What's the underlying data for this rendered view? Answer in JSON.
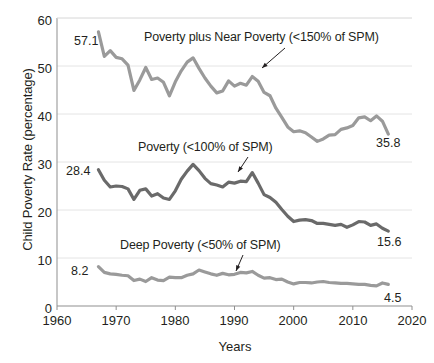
{
  "chart_data": {
    "type": "line",
    "title": "",
    "xlabel": "Years",
    "ylabel": "Child Poverty Rate (percentage)",
    "xlim": [
      1960,
      2020
    ],
    "ylim": [
      0,
      60
    ],
    "xticks": [
      1960,
      1970,
      1980,
      1990,
      2000,
      2010,
      2020
    ],
    "yticks": [
      0,
      10,
      20,
      30,
      40,
      50,
      60
    ],
    "grid": "horizontal",
    "legend_position": "inline-annotations",
    "x": [
      1967,
      1968,
      1969,
      1970,
      1971,
      1972,
      1973,
      1974,
      1975,
      1976,
      1977,
      1978,
      1979,
      1980,
      1981,
      1982,
      1983,
      1984,
      1985,
      1986,
      1987,
      1988,
      1989,
      1990,
      1991,
      1992,
      1993,
      1994,
      1995,
      1996,
      1997,
      1998,
      1999,
      2000,
      2001,
      2002,
      2003,
      2004,
      2005,
      2006,
      2007,
      2008,
      2009,
      2010,
      2011,
      2012,
      2013,
      2014,
      2015,
      2016
    ],
    "series": [
      {
        "name": "Poverty plus Near Poverty (<150% of SPM)",
        "color": "#9a9a9a",
        "start_label": "57.1",
        "end_label": "35.8",
        "values": [
          57.1,
          52.0,
          53.2,
          51.8,
          51.5,
          50.2,
          44.9,
          47.1,
          49.7,
          47.2,
          47.5,
          46.6,
          43.8,
          46.7,
          49.0,
          50.8,
          51.7,
          49.5,
          47.5,
          45.8,
          44.4,
          44.8,
          46.9,
          45.8,
          46.4,
          46.0,
          47.8,
          46.8,
          44.5,
          43.8,
          41.2,
          39.3,
          37.3,
          36.3,
          36.5,
          36.1,
          35.2,
          34.3,
          34.8,
          35.6,
          35.7,
          36.8,
          37.1,
          37.6,
          39.2,
          39.4,
          38.6,
          39.6,
          38.5,
          35.8
        ]
      },
      {
        "name": "Poverty (<100% of SPM)",
        "color": "#6a6a6a",
        "start_label": "28.4",
        "end_label": "15.6",
        "values": [
          28.4,
          26.2,
          24.8,
          25.0,
          24.9,
          24.4,
          22.2,
          24.1,
          24.4,
          22.9,
          23.4,
          22.5,
          22.2,
          24.0,
          26.4,
          28.1,
          29.5,
          28.2,
          26.6,
          25.5,
          25.2,
          24.8,
          25.8,
          25.6,
          26.0,
          25.9,
          27.8,
          25.6,
          23.2,
          22.6,
          21.6,
          20.1,
          18.7,
          17.6,
          17.9,
          18.0,
          17.8,
          17.2,
          17.2,
          17.0,
          16.8,
          17.0,
          16.4,
          16.9,
          17.6,
          17.5,
          16.8,
          17.1,
          16.2,
          15.6
        ]
      },
      {
        "name": "Deep Poverty (<50% of SPM)",
        "color": "#9a9a9a",
        "start_label": "8.2",
        "end_label": "4.5",
        "values": [
          8.2,
          7.0,
          6.7,
          6.6,
          6.4,
          6.3,
          5.3,
          5.6,
          5.1,
          5.9,
          5.4,
          5.3,
          6.0,
          5.9,
          5.9,
          6.4,
          6.7,
          7.5,
          7.1,
          6.7,
          6.4,
          6.8,
          6.5,
          6.6,
          7.0,
          6.9,
          7.2,
          6.4,
          5.8,
          5.9,
          5.5,
          5.6,
          5.0,
          4.6,
          4.9,
          4.9,
          4.8,
          5.0,
          5.1,
          4.9,
          4.8,
          4.7,
          4.7,
          4.6,
          4.5,
          4.5,
          4.3,
          4.2,
          4.8,
          4.5
        ]
      }
    ],
    "annotations": [
      {
        "id": "top-label",
        "text": "Poverty plus Near Poverty (<150% of SPM)"
      },
      {
        "id": "mid-label",
        "text": "Poverty (<100% of SPM)"
      },
      {
        "id": "bottom-label",
        "text": "Deep Poverty (<50% of SPM)"
      }
    ]
  },
  "axis": {
    "y_title": "Child Poverty Rate (percentage)",
    "x_title": "Years",
    "y_tick_labels": [
      "60",
      "50",
      "40",
      "30",
      "20",
      "10",
      "0"
    ],
    "x_tick_labels": [
      "1960",
      "1970",
      "1980",
      "1990",
      "2000",
      "2010",
      "2020"
    ]
  },
  "labels": {
    "top_series": "Poverty plus Near Poverty (<150% of SPM)",
    "mid_series": "Poverty (<100% of SPM)",
    "bottom_series": "Deep Poverty (<50% of SPM)",
    "top_start": "57.1",
    "top_end": "35.8",
    "mid_start": "28.4",
    "mid_end": "15.6",
    "bottom_start": "8.2",
    "bottom_end": "4.5"
  },
  "colors": {
    "line_light": "#9a9a9a",
    "line_dark": "#6a6a6a",
    "grid": "#e4e4e4",
    "axis": "#8f8f8f",
    "text": "#231f20"
  }
}
